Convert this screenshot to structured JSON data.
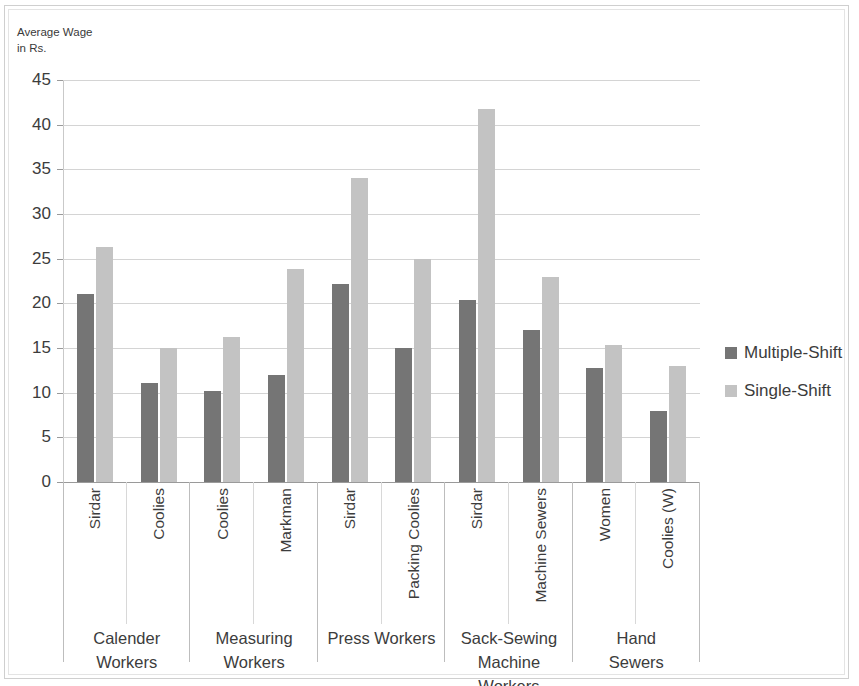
{
  "axis_title": "Average Wage\nin Rs.",
  "legend": {
    "items": [
      {
        "label": "Multiple-Shift",
        "color": "#757575"
      },
      {
        "label": "Single-Shift",
        "color": "#c3c3c3"
      }
    ]
  },
  "chart_data": {
    "type": "bar",
    "title": "",
    "subtitle": "",
    "xlabel": "",
    "ylabel": "Average Wage\nin Rs.",
    "ylim": [
      0,
      45
    ],
    "ytick_labels": [
      "45",
      "40",
      "35",
      "30",
      "25",
      "20",
      "15",
      "10",
      "5",
      "0"
    ],
    "ytick_values": [
      45,
      40,
      35,
      30,
      25,
      20,
      15,
      10,
      5,
      0
    ],
    "grid": true,
    "legend_position": "right",
    "series": [
      {
        "name": "Multiple-Shift",
        "color": "#757575",
        "values": [
          21.1,
          11.1,
          10.2,
          12.0,
          22.2,
          15.0,
          20.4,
          17.0,
          12.8,
          8.0
        ]
      },
      {
        "name": "Single-Shift",
        "color": "#c3c3c3",
        "values": [
          26.3,
          15.0,
          16.2,
          23.8,
          34.0,
          25.0,
          41.8,
          23.0,
          15.3,
          13.0
        ]
      }
    ],
    "categories": [
      "Sirdar",
      "Coolies",
      "Coolies",
      "Markman",
      "Sirdar",
      "Packing Coolies",
      "Sirdar",
      "Machine Sewers",
      "Women",
      "Coolies (W)"
    ],
    "groups": [
      {
        "name": "Calender\nWorkers",
        "subcategories": [
          {
            "label": "Sirdar",
            "multiple_shift": 21.1,
            "single_shift": 26.3
          },
          {
            "label": "Coolies",
            "multiple_shift": 11.1,
            "single_shift": 15.0
          }
        ]
      },
      {
        "name": "Measuring\nWorkers",
        "subcategories": [
          {
            "label": "Coolies",
            "multiple_shift": 10.2,
            "single_shift": 16.2
          },
          {
            "label": "Markman",
            "multiple_shift": 12.0,
            "single_shift": 23.8
          }
        ]
      },
      {
        "name": "Press Workers",
        "subcategories": [
          {
            "label": "Sirdar",
            "multiple_shift": 22.2,
            "single_shift": 34.0
          },
          {
            "label": "Packing Coolies",
            "multiple_shift": 15.0,
            "single_shift": 25.0
          }
        ]
      },
      {
        "name": "Sack-Sewing\nMachine Workers",
        "subcategories": [
          {
            "label": "Sirdar",
            "multiple_shift": 20.4,
            "single_shift": 41.8
          },
          {
            "label": "Machine Sewers",
            "multiple_shift": 17.0,
            "single_shift": 23.0
          }
        ]
      },
      {
        "name": "Hand\nSewers",
        "subcategories": [
          {
            "label": "Women",
            "multiple_shift": 12.8,
            "single_shift": 15.3
          },
          {
            "label": "Coolies (W)",
            "multiple_shift": 8.0,
            "single_shift": 13.0
          }
        ]
      }
    ]
  }
}
